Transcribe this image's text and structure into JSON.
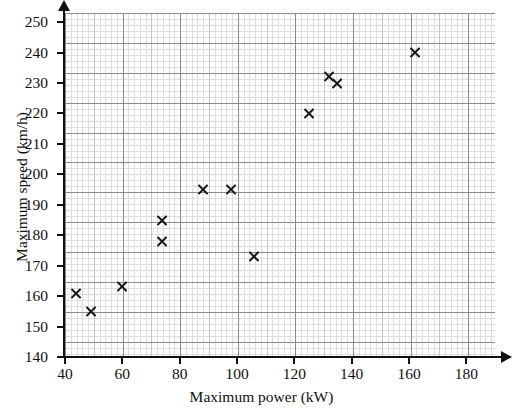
{
  "chart_data": {
    "type": "scatter",
    "title": "",
    "xlabel": "Maximum power (kW)",
    "ylabel": "Maximum speed (km/h)",
    "xlim": [
      40,
      190
    ],
    "ylim": [
      140,
      253
    ],
    "grid": true,
    "legend": false,
    "marker": "x",
    "marker_color": "#1a1a1a",
    "x_ticks": [
      40,
      60,
      80,
      100,
      120,
      140,
      160,
      180
    ],
    "y_ticks": [
      140,
      150,
      160,
      170,
      180,
      190,
      200,
      210,
      220,
      230,
      240,
      250
    ],
    "x": [
      44,
      49,
      60,
      74,
      74,
      88,
      98,
      106,
      125,
      132,
      135,
      162
    ],
    "y": [
      161,
      155,
      163,
      185,
      178,
      195,
      195,
      173,
      220,
      232,
      230,
      240
    ],
    "points": [
      {
        "x": 44,
        "y": 161
      },
      {
        "x": 49,
        "y": 155
      },
      {
        "x": 60,
        "y": 163
      },
      {
        "x": 74,
        "y": 185
      },
      {
        "x": 74,
        "y": 178
      },
      {
        "x": 88,
        "y": 195
      },
      {
        "x": 98,
        "y": 195
      },
      {
        "x": 106,
        "y": 173
      },
      {
        "x": 125,
        "y": 220
      },
      {
        "x": 132,
        "y": 232
      },
      {
        "x": 135,
        "y": 230
      },
      {
        "x": 162,
        "y": 240
      }
    ]
  }
}
